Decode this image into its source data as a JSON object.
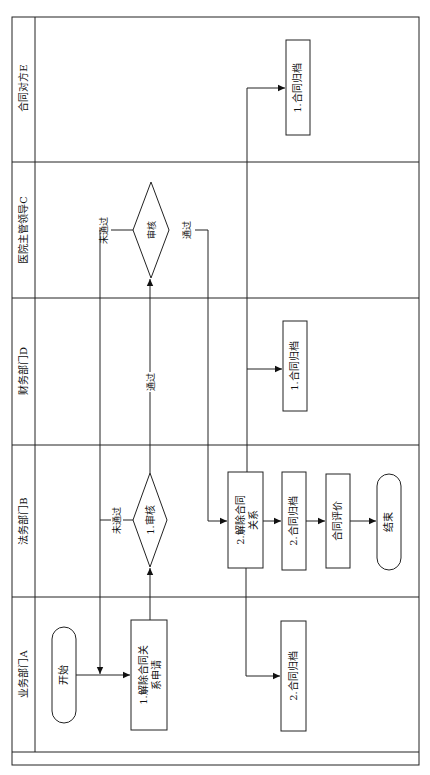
{
  "diagram": {
    "type": "swimlane-flowchart",
    "orientation": "rotated-90",
    "lanes": [
      {
        "id": "E",
        "label": "合同对方E"
      },
      {
        "id": "C",
        "label": "医院主管领导C"
      },
      {
        "id": "D",
        "label": "财务部门D"
      },
      {
        "id": "B",
        "label": "法务部门B"
      },
      {
        "id": "A",
        "label": "业务部门A"
      }
    ],
    "nodes": {
      "start": {
        "label": "开始",
        "shape": "terminal",
        "lane": "A"
      },
      "apply": {
        "label_line1": "1.解除合同关",
        "label_line2": "系申请",
        "shape": "process",
        "lane": "A"
      },
      "archive_a": {
        "label": "2.合同归档",
        "shape": "process",
        "lane": "A"
      },
      "review_b": {
        "label": "1.审核",
        "shape": "decision",
        "lane": "B"
      },
      "terminate": {
        "label_line1": "2.解除合同",
        "label_line2": "关系",
        "shape": "process",
        "lane": "B"
      },
      "archive_b": {
        "label": "2.合同归档",
        "shape": "process",
        "lane": "B"
      },
      "evaluate": {
        "label": "合同评价",
        "shape": "process",
        "lane": "B"
      },
      "end": {
        "label": "结束",
        "shape": "terminal",
        "lane": "B"
      },
      "archive_d": {
        "label": "1.合同归档",
        "shape": "process",
        "lane": "D"
      },
      "review_c": {
        "label": "审核",
        "shape": "decision",
        "lane": "C"
      },
      "archive_e": {
        "label": "1.合同归档",
        "shape": "process",
        "lane": "E"
      }
    },
    "edge_labels": {
      "b_fail": "未通过",
      "b_pass": "通过",
      "c_fail": "未通过",
      "c_pass": "通过"
    }
  }
}
